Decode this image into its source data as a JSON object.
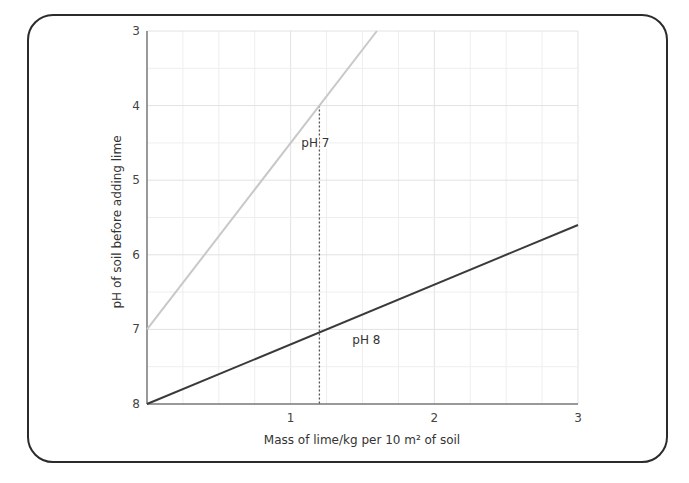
{
  "chart_data": {
    "type": "line",
    "title": "",
    "xlabel": "Mass of lime/kg per 10 m² of soil",
    "ylabel": "pH of soil before adding lime",
    "xlim": [
      0,
      3
    ],
    "ylim": [
      8,
      3
    ],
    "y_inverted": true,
    "x_ticks": [
      "1",
      "2",
      "3"
    ],
    "y_ticks": [
      "3",
      "4",
      "5",
      "6",
      "7",
      "8"
    ],
    "grid": true,
    "series": [
      {
        "name": "pH 7",
        "color": "#c8c8c8",
        "x": [
          0,
          1.6
        ],
        "y": [
          7,
          3
        ]
      },
      {
        "name": "pH 8",
        "color": "#3a3a3a",
        "x": [
          0,
          3
        ],
        "y": [
          8,
          5.6
        ]
      }
    ],
    "annotations": [
      {
        "text": "pH 7",
        "x": 1.2,
        "y": 4.55
      },
      {
        "text": "pH 8",
        "x": 1.45,
        "y": 7.2
      },
      {
        "type": "dotted-vertical",
        "x": 1.2,
        "y_from": 4,
        "y_to": 8
      }
    ]
  }
}
